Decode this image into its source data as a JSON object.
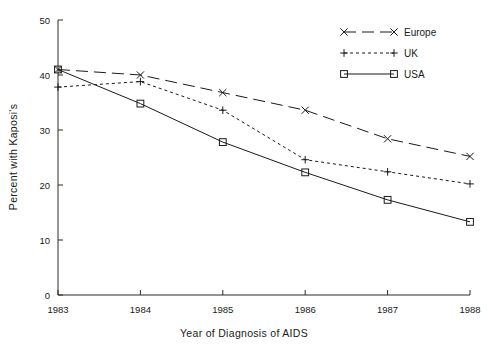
{
  "chart_data": {
    "type": "line",
    "title": "",
    "xlabel": "Year of Diagnosis of AIDS",
    "ylabel": "Percent with Kaposi's",
    "categories": [
      "1983",
      "1984",
      "1985",
      "1986",
      "1987",
      "1988"
    ],
    "x": [
      1983,
      1984,
      1985,
      1986,
      1987,
      1988
    ],
    "xlim": [
      1983,
      1988
    ],
    "ylim": [
      0,
      50
    ],
    "yticks": [
      0,
      10,
      20,
      30,
      40,
      50
    ],
    "ytick_labels": [
      "0",
      "10",
      "20",
      "30",
      "40",
      "50"
    ],
    "xtick_labels": [
      "1983",
      "1984",
      "1985",
      "1986",
      "1987",
      "1988"
    ],
    "grid": false,
    "legend_position": "top-right",
    "series": [
      {
        "name": "Europe",
        "values": [
          41.0,
          40.0,
          36.8,
          33.6,
          28.4,
          25.2
        ],
        "line_style": "long-dash",
        "marker": "x",
        "color": "#1a1a1a"
      },
      {
        "name": "UK",
        "values": [
          37.8,
          38.8,
          33.6,
          24.6,
          22.4,
          20.2
        ],
        "line_style": "dotted",
        "marker": "plus",
        "color": "#1a1a1a"
      },
      {
        "name": "USA",
        "values": [
          41.0,
          34.8,
          27.8,
          22.3,
          17.3,
          13.3
        ],
        "line_style": "solid",
        "marker": "square",
        "color": "#1a1a1a"
      }
    ]
  },
  "legend": {
    "entries": [
      {
        "label": "Europe"
      },
      {
        "label": "UK"
      },
      {
        "label": "USA"
      }
    ]
  },
  "axes": {
    "y_title": "Percent with Kaposi's",
    "x_title": "Year of Diagnosis of AIDS"
  }
}
